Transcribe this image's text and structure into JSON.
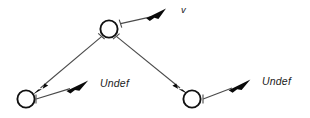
{
  "diagram": {
    "type": "node-link-diagram",
    "background_color": "#ffffff",
    "stroke_color": "#4a4a4a",
    "node_stroke_color": "#111111",
    "arrow_fill_color": "#0a0a0a",
    "nodes": [
      {
        "id": "root",
        "name": "root-node",
        "cx": 109,
        "cy": 29,
        "r": 8.6
      },
      {
        "id": "left",
        "name": "left-node",
        "cx": 26,
        "cy": 99,
        "r": 8.6
      },
      {
        "id": "right",
        "name": "right-node",
        "cx": 192,
        "cy": 99,
        "r": 8.6
      }
    ],
    "edges": [
      {
        "id": "root-to-left",
        "name": "edge-root-to-left",
        "from": "root",
        "to": "left",
        "x1": 102,
        "y1": 37,
        "x2": 36,
        "y2": 91
      },
      {
        "id": "root-to-right",
        "name": "edge-root-to-right",
        "from": "root",
        "to": "right",
        "x1": 117,
        "y1": 37,
        "x2": 184,
        "y2": 91
      }
    ],
    "pointers": [
      {
        "id": "root-v",
        "name": "pointer-root-to-v",
        "label": "v",
        "x1": 120,
        "y1": 25,
        "x2": 166,
        "y2": 10
      },
      {
        "id": "left-undef",
        "name": "pointer-left-to-undef",
        "label": "Undef",
        "x1": 37,
        "y1": 99,
        "x2": 88,
        "y2": 83
      },
      {
        "id": "right-undef",
        "name": "pointer-right-to-undef",
        "label": "Undef",
        "x1": 203,
        "y1": 99,
        "x2": 250,
        "y2": 81
      }
    ],
    "labels": [
      {
        "id": "label-v",
        "name": "label-v",
        "text": "v",
        "x": 181,
        "y": 13,
        "style": "italic"
      },
      {
        "id": "label-undef-left",
        "name": "label-undef-left",
        "text": "Undef",
        "x": 100,
        "y": 87,
        "style": "italic"
      },
      {
        "id": "label-undef-right",
        "name": "label-undef-right",
        "text": "Undef",
        "x": 262,
        "y": 85,
        "style": "italic"
      }
    ]
  }
}
